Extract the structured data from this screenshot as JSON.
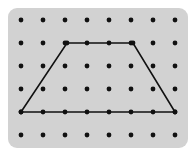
{
  "figure": {
    "canvas": {
      "width": 195,
      "height": 155,
      "background": "#ffffff"
    },
    "board": {
      "name": "geoboard",
      "x": 8,
      "y": 8,
      "width": 180,
      "height": 140,
      "corner_radius": 9,
      "fill": "#d2d2d2",
      "stroke": "none"
    },
    "grid": {
      "columns": 8,
      "rows": 6,
      "origin_x": 21,
      "origin_y": 20,
      "spacing_x": 22,
      "spacing_y": 23,
      "peg_radius": 2.4,
      "peg_color": "#111111"
    },
    "shape": {
      "name": "trapezoid",
      "type": "polygon",
      "stroke": "#111111",
      "stroke_width": 1.6,
      "fill": "none",
      "vertices": [
        {
          "label": "top-left",
          "col": 3,
          "row": 2,
          "x": 67,
          "y": 43
        },
        {
          "label": "top-right",
          "col": 6,
          "row": 2,
          "x": 133,
          "y": 43
        },
        {
          "label": "bottom-right",
          "col": 8,
          "row": 5,
          "x": 175,
          "y": 112
        },
        {
          "label": "bottom-left",
          "col": 1,
          "row": 5,
          "x": 21,
          "y": 112
        }
      ]
    }
  }
}
